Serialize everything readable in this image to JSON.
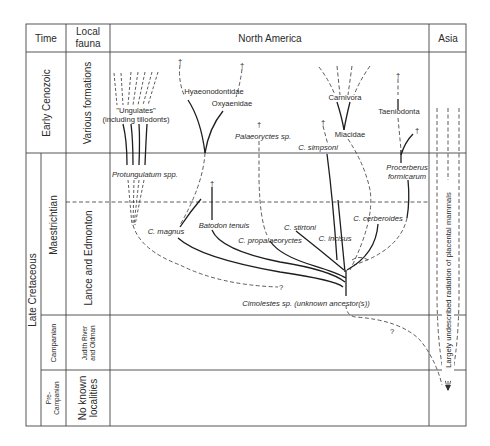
{
  "figure": {
    "headers": {
      "time": "Time",
      "local_fauna_line1": "Local",
      "local_fauna_line2": "fauna",
      "north_america": "North America",
      "asia": "Asia"
    },
    "time_periods": {
      "early_cenozoic": "Early Cenozoic",
      "late_cretaceous": "Late Cretaceous"
    },
    "stages": {
      "maestrichtian": "Maestrichtian",
      "campanian": "Campanian",
      "pre_campanian_line1": "Pre-",
      "pre_campanian_line2": "Campanian"
    },
    "local_faunas": {
      "various_formations": "Various formations",
      "lance_edmonton": "Lance and Edmonton",
      "judith_line1": "Judith River",
      "judith_line2": "and Oldman",
      "no_known_line1": "No known",
      "no_known_line2": "localities"
    },
    "taxa": {
      "ungulates_line1": "\"Ungulates\"",
      "ungulates_line2": "(including tillodonts)",
      "hyaenodontidae": "Hyaeonodontidae",
      "oxyaenidae": "Oxyaenidae",
      "palaeoryctes": "Palaeoryctes sp.",
      "carnivora": "Carnivora",
      "miacidae": "Miacidae",
      "c_simpsoni": "C. simpsoni",
      "taeniodonta": "Taeniodonta",
      "protungulatum": "Protungulatum spp.",
      "procerberus_line1": "Procerberus",
      "procerberus_line2": "formicarum",
      "c_magnus": "C. magnus",
      "batodon": "Batodon tenuis",
      "c_propalaeoryctes": "C. propalaeoryctes",
      "c_stirtoni": "C. stirtoni",
      "c_incisus": "C. incisus",
      "c_cerberoides": "C. cerberoides",
      "cimolestes": "Cimolestes sp. (unknown ancestor(s))",
      "asia_note": "Largely undescribed radiation of placental mammals"
    },
    "symbols": {
      "extinction": "†",
      "uncertain": "?"
    }
  }
}
